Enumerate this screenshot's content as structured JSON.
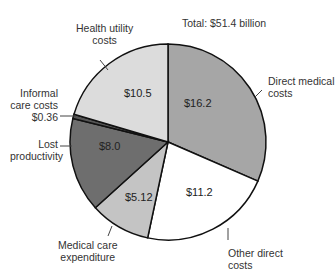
{
  "chart_data": {
    "type": "pie",
    "title": "Total: $51.4 billion",
    "unit": "$ billion",
    "slices": [
      {
        "label": "Direct medical costs",
        "value": 16.2,
        "value_label": "$16.2",
        "color": "#a6a6a6"
      },
      {
        "label": "Other direct costs",
        "value": 11.2,
        "value_label": "$11.2",
        "color": "#ffffff"
      },
      {
        "label": "Medical care expenditure",
        "value": 5.12,
        "value_label": "$5.12",
        "color": "#c4c4c4"
      },
      {
        "label": "Lost productivity",
        "value": 8.0,
        "value_label": "$8.0",
        "color": "#6e6e6e"
      },
      {
        "label": "Informal care costs",
        "value": 0.36,
        "value_label": "$0.36",
        "color": "#555555"
      },
      {
        "label": "Health utility costs",
        "value": 10.5,
        "value_label": "$10.5",
        "color": "#dcdcdc"
      }
    ]
  },
  "labels": {
    "title": "Total: $51.4 billion",
    "direct_medical_1": "Direct medical",
    "direct_medical_2": "costs",
    "other_direct_1": "Other direct",
    "other_direct_2": "costs",
    "medical_care_1": "Medical care",
    "medical_care_2": "expenditure",
    "lost_1": "Lost",
    "lost_2": "productivity",
    "informal_1": "Informal",
    "informal_2": "care costs",
    "informal_3": "$0.36",
    "health_1": "Health utility",
    "health_2": "costs",
    "v_direct": "$16.2",
    "v_other": "$11.2",
    "v_medical": "$5.12",
    "v_lost": "$8.0",
    "v_health": "$10.5"
  }
}
